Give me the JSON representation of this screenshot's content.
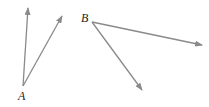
{
  "diagram": {
    "stroke_color": "#8a8a8a",
    "angles": [
      {
        "vertex_label": "A",
        "vertex": [
          23,
          86
        ],
        "label_pos": [
          18,
          90
        ],
        "rays": [
          [
            28,
            8
          ],
          [
            62,
            16
          ]
        ]
      },
      {
        "vertex_label": "B",
        "vertex": [
          92,
          22
        ],
        "label_pos": [
          81,
          12
        ],
        "rays": [
          [
            202,
            45
          ],
          [
            142,
            90
          ]
        ]
      }
    ]
  }
}
